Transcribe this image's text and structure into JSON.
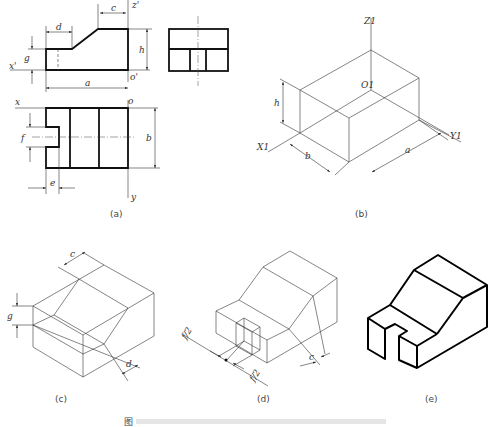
{
  "figure": {
    "panels": [
      {
        "id": "a",
        "caption": "(a)",
        "description": "Three orthographic views (front, side, top) with dimensions"
      },
      {
        "id": "b",
        "caption": "(b)",
        "description": "Isometric bounding box with axes"
      },
      {
        "id": "c",
        "caption": "(c)",
        "description": "Isometric construction of sloped cut"
      },
      {
        "id": "d",
        "caption": "(d)",
        "description": "Isometric construction of slot"
      },
      {
        "id": "e",
        "caption": "(e)",
        "description": "Finished isometric drawing"
      }
    ],
    "bottom_caption": "图"
  },
  "labels": {
    "a": {
      "c": "c",
      "d": "d",
      "g": "g",
      "h": "h",
      "a": "a",
      "b": "b",
      "e": "e",
      "f": "f",
      "z_prime": "z'",
      "x_prime": "x'",
      "o_prime": "o'",
      "x": "x",
      "o": "o",
      "y": "y"
    },
    "b": {
      "Z1": "Z1",
      "O1": "O1",
      "X1": "X1",
      "Y1": "Y1",
      "h": "h",
      "b": "b",
      "a": "a"
    },
    "c": {
      "c": "c",
      "g": "g",
      "d": "d"
    },
    "d": {
      "f2_left": "f/2",
      "f2_right": "f/2",
      "c": "c"
    }
  }
}
